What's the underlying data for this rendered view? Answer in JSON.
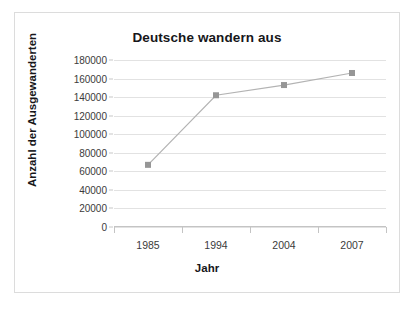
{
  "chart_data": {
    "type": "line",
    "title": "Deutsche wandern aus",
    "xlabel": "Jahr",
    "ylabel": "Anzahl der Ausgewanderten",
    "categories": [
      "1985",
      "1994",
      "2004",
      "2007"
    ],
    "values": [
      67000,
      142000,
      153000,
      166000
    ],
    "series": [
      {
        "name": "Ausgewanderte",
        "values": [
          67000,
          142000,
          153000,
          166000
        ]
      }
    ],
    "ylim": [
      0,
      180000
    ],
    "ytick_labels": [
      "180000",
      "160000",
      "140000",
      "120000",
      "100000",
      "80000",
      "60000",
      "40000",
      "20000",
      "0"
    ],
    "ytick_values": [
      180000,
      160000,
      140000,
      120000,
      100000,
      80000,
      60000,
      40000,
      20000,
      0
    ],
    "grid": true,
    "legend": false,
    "legend_position": "none",
    "colors": {
      "line": "#b3b3b3",
      "marker": "#969696",
      "gridline": "#e2e2e2",
      "axis": "#c4c4c4",
      "text": "#17171a",
      "tick_text": "#3b3b3b",
      "frame": "#dcdcdc",
      "background": "#ffffff"
    }
  }
}
